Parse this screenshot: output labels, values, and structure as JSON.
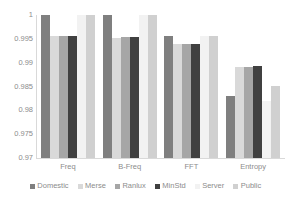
{
  "chart_data": {
    "type": "bar",
    "title": "",
    "xlabel": "",
    "ylabel": "",
    "categories": [
      "Freq",
      "B-Freq",
      "FFT",
      "Entropy"
    ],
    "ylim": [
      0.97,
      1
    ],
    "yticks": [
      1,
      0.995,
      0.99,
      0.985,
      0.98,
      0.975,
      0.97
    ],
    "ytick_labels": [
      "1",
      "0.995",
      "0.99",
      "0.985",
      "0.98",
      "0.975",
      "0.97"
    ],
    "grid": false,
    "legend_position": "bottom",
    "series": [
      {
        "name": "Domestic",
        "color": "#7f7f7f",
        "values": [
          1,
          1,
          0.9955,
          0.983
        ]
      },
      {
        "name": "Merse",
        "color": "#d9d9d9",
        "values": [
          0.9955,
          0.9952,
          0.9939,
          0.9891
        ]
      },
      {
        "name": "Ranlux",
        "color": "#a6a6a6",
        "values": [
          0.9957,
          0.9953,
          0.9939,
          0.9891
        ]
      },
      {
        "name": "MinStd",
        "color": "#404040",
        "values": [
          0.9957,
          0.9953,
          0.9939,
          0.9892
        ]
      },
      {
        "name": "Server",
        "color": "#f2f2f2",
        "values": [
          1,
          1,
          0.9955,
          0.982
        ]
      },
      {
        "name": "Public",
        "color": "#d0d0d0",
        "values": [
          1,
          1,
          0.9955,
          0.9852
        ]
      }
    ]
  }
}
